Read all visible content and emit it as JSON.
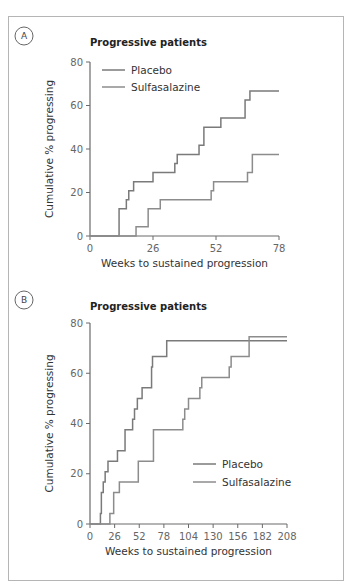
{
  "figure": {
    "panels": [
      "A",
      "B"
    ]
  },
  "colors": {
    "placebo": "#7a7a7a",
    "sulfasalazine": "#8c8c8c",
    "axis": "#6a6a6a",
    "frame": "#b5b5b5"
  },
  "chart_data": [
    {
      "panel": "A",
      "type": "line",
      "step": true,
      "title": "Progressive patients",
      "xlabel": "Weeks to sustained progression",
      "ylabel": "Cumulative % progressing",
      "xlim": [
        0,
        78
      ],
      "ylim": [
        0,
        80
      ],
      "xticks": [
        0,
        26,
        52,
        78
      ],
      "yticks": [
        0,
        20,
        40,
        60,
        80
      ],
      "grid": false,
      "legend_position": "upper left",
      "series": [
        {
          "name": "Placebo",
          "x": [
            0,
            12,
            15,
            16,
            18,
            26,
            35,
            36,
            45,
            47,
            54,
            64,
            66,
            78
          ],
          "y": [
            0,
            12.5,
            16.7,
            20.8,
            25,
            29.2,
            33.3,
            37.5,
            41.7,
            50,
            54.2,
            62.5,
            66.7,
            66.7
          ]
        },
        {
          "name": "Sulfasalazine",
          "x": [
            0,
            19,
            24,
            29,
            50,
            51,
            65,
            67,
            78
          ],
          "y": [
            0,
            4.2,
            12.5,
            16.7,
            20.8,
            25,
            29.2,
            37.5,
            37.5
          ]
        }
      ]
    },
    {
      "panel": "B",
      "type": "line",
      "step": true,
      "title": "Progressive patients",
      "xlabel": "Weeks to sustained progression",
      "ylabel": "Cumulative % progressing",
      "xlim": [
        0,
        208
      ],
      "ylim": [
        0,
        80
      ],
      "xticks": [
        0,
        26,
        52,
        78,
        104,
        130,
        156,
        182,
        208
      ],
      "yticks": [
        0,
        20,
        40,
        60,
        80
      ],
      "grid": false,
      "legend_position": "lower right",
      "series": [
        {
          "name": "Placebo",
          "x": [
            0,
            11,
            12,
            14,
            16,
            19,
            29,
            37,
            45,
            47,
            50,
            55,
            65,
            66,
            81,
            208
          ],
          "y": [
            0,
            4.2,
            12.5,
            16.7,
            20.8,
            25,
            29.2,
            37.5,
            41.7,
            45.8,
            50,
            54.2,
            62.5,
            66.7,
            72.9,
            72.9
          ]
        },
        {
          "name": "Sulfasalazine",
          "x": [
            0,
            21,
            25,
            31,
            51,
            67,
            98,
            100,
            104,
            116,
            118,
            147,
            149,
            168,
            208
          ],
          "y": [
            0,
            4.2,
            12.5,
            16.7,
            25,
            37.5,
            41.7,
            45.8,
            50,
            54.2,
            58.3,
            62.5,
            66.7,
            74.5,
            74.5
          ]
        }
      ]
    }
  ],
  "layout": [
    {
      "badge": {
        "cx": 24,
        "cy": 36
      },
      "title_pos": {
        "x": 90,
        "y": 46
      },
      "plot": {
        "x0": 90,
        "x1": 279,
        "y0": 236,
        "y1": 62
      },
      "legend": {
        "x": 102,
        "y": 70,
        "dy": 17
      }
    },
    {
      "badge": {
        "cx": 24,
        "cy": 300
      },
      "title_pos": {
        "x": 90,
        "y": 310
      },
      "plot": {
        "x0": 90,
        "x1": 287,
        "y0": 524,
        "y1": 323
      },
      "legend": {
        "x": 193,
        "y": 464,
        "dy": 18
      }
    }
  ]
}
